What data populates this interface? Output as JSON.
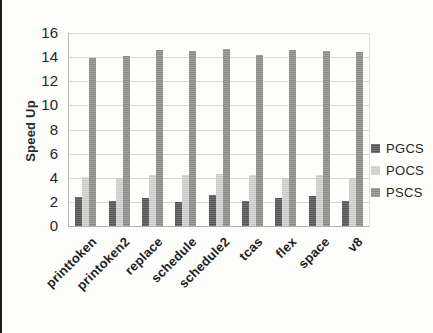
{
  "chart_data": {
    "type": "bar",
    "title": "",
    "xlabel": "",
    "ylabel": "Speed Up",
    "ylim": [
      0,
      16
    ],
    "yticks": [
      0,
      2,
      4,
      6,
      8,
      10,
      12,
      14,
      16
    ],
    "grid": true,
    "legend_position": "right",
    "categories": [
      "printtoken",
      "printoken2",
      "replace",
      "schedule",
      "schedule2",
      "tcas",
      "flex",
      "space",
      "v8"
    ],
    "series": [
      {
        "name": "PGCS",
        "color": "#585858",
        "values": [
          2.4,
          2.1,
          2.3,
          2.0,
          2.6,
          2.1,
          2.3,
          2.5,
          2.1
        ]
      },
      {
        "name": "POCS",
        "color": "#d2d2d0",
        "values": [
          4.1,
          4.0,
          4.2,
          4.2,
          4.3,
          4.2,
          4.0,
          4.2,
          4.0
        ]
      },
      {
        "name": "PSCS",
        "color": "#8f8f8d",
        "values": [
          13.9,
          14.1,
          14.6,
          14.5,
          14.7,
          14.2,
          14.6,
          14.5,
          14.4
        ]
      }
    ]
  },
  "colors": {
    "gridline": "#d8d8d6",
    "axis": "#b0b0b0",
    "text": "#262626",
    "scan_edge": "#1c1c1c"
  }
}
